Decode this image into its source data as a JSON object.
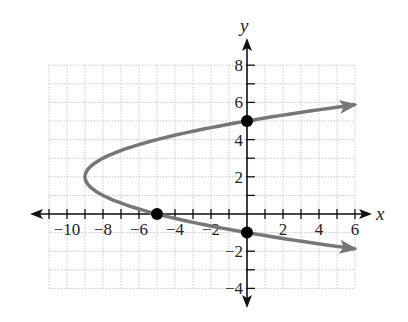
{
  "chart_data": {
    "type": "line",
    "title": "",
    "xlabel": "x",
    "ylabel": "y",
    "xlim": [
      -11,
      6
    ],
    "ylim": [
      -4,
      8
    ],
    "grid": true,
    "x_ticks": [
      -10,
      -8,
      -6,
      -4,
      -2,
      2,
      4,
      6
    ],
    "x_tick_labels": [
      "−10",
      "−8",
      "−6",
      "−4",
      "−2",
      "2",
      "4",
      "6"
    ],
    "y_ticks": [
      8,
      6,
      4,
      2,
      -2,
      -4
    ],
    "y_tick_labels": [
      "8",
      "6",
      "4",
      "2",
      "−2",
      "−4"
    ],
    "series": [
      {
        "name": "x = (y − 2)² − 9",
        "equation": "x = y^2 - 4y - 5",
        "vertex": [
          -9,
          2
        ],
        "color": "#777777",
        "y_range": [
          -1.87,
          5.87
        ],
        "arrows": "both-ends",
        "end_points": [
          [
            6,
            5.87
          ],
          [
            6,
            -1.87
          ]
        ]
      }
    ],
    "points": [
      {
        "label": "x-intercept",
        "x": -5,
        "y": 0
      },
      {
        "label": "y-intercept upper",
        "x": 0,
        "y": 5
      },
      {
        "label": "y-intercept lower",
        "x": 0,
        "y": -1
      }
    ],
    "colors": {
      "axis": "#111111",
      "curve": "#777777",
      "grid": "#c8c8c8",
      "point": "#000000"
    }
  }
}
